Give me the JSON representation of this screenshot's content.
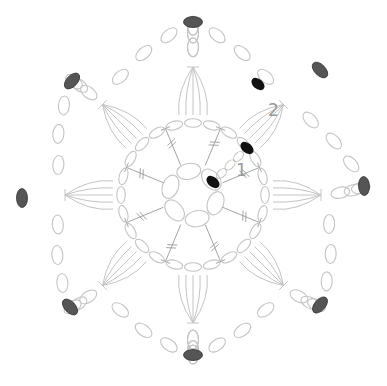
{
  "diagram": {
    "type": "crochet-chart",
    "center": [
      193,
      195
    ],
    "round_labels": [
      {
        "text": "1",
        "x": 236,
        "y": 164
      },
      {
        "text": "2",
        "x": 268,
        "y": 104
      }
    ],
    "colors": {
      "stitch_outline": "#c4c4c4",
      "marker_dark": "#555555",
      "marker_black": "#111111",
      "label": "#9a9a9a"
    },
    "outer_markers": [
      [
        193,
        22
      ],
      [
        320,
        70
      ],
      [
        364,
        186
      ],
      [
        320,
        305
      ],
      [
        193,
        355
      ],
      [
        70,
        307
      ],
      [
        22,
        198
      ],
      [
        72,
        81
      ]
    ],
    "start_markers": [
      [
        258,
        84
      ],
      [
        247,
        148
      ],
      [
        213,
        182
      ]
    ],
    "petal_count": 8
  }
}
